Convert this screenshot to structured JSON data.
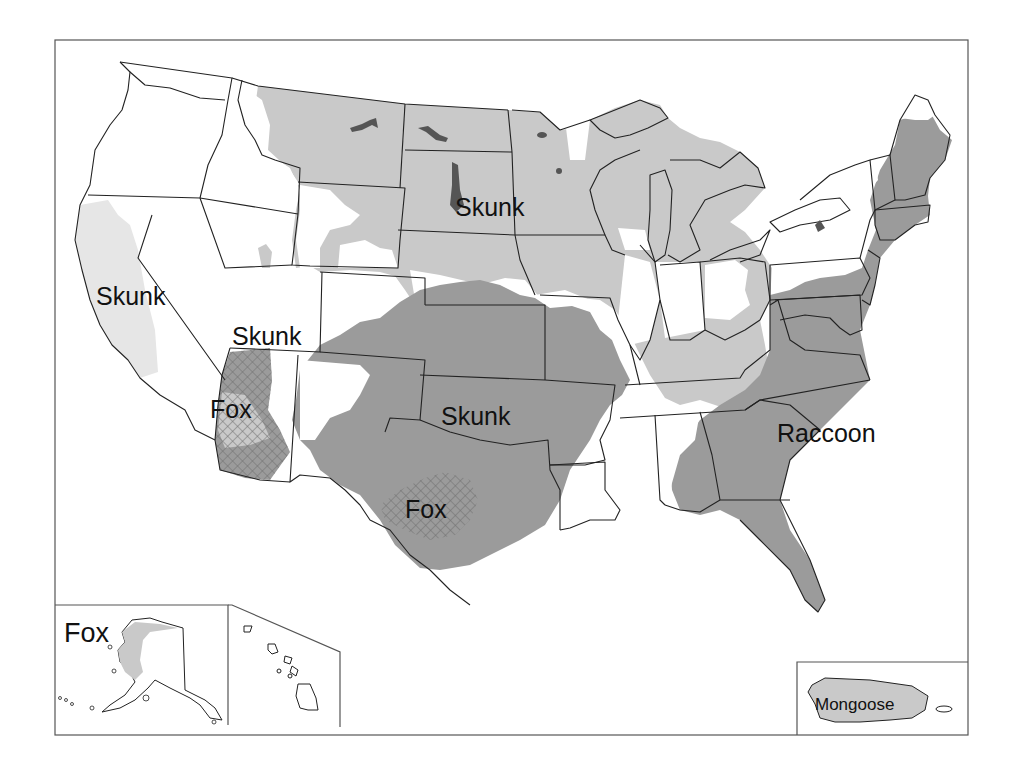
{
  "map": {
    "title": "",
    "colors": {
      "background": "#ffffff",
      "skunk_light": "#c9c9c9",
      "skunk_california": "#e6e6e6",
      "raccoon_dark": "#9b9b9b",
      "fox_hatch": "#7a7a7a",
      "border": "#222222",
      "water": "#555555"
    },
    "labels": [
      {
        "id": "skunk-north-central",
        "text": "Skunk",
        "x": 455,
        "y": 216
      },
      {
        "id": "skunk-california",
        "text": "Skunk",
        "x": 96,
        "y": 305
      },
      {
        "id": "skunk-southwest",
        "text": "Skunk",
        "x": 232,
        "y": 345
      },
      {
        "id": "fox-arizona",
        "text": "Fox",
        "x": 210,
        "y": 418
      },
      {
        "id": "skunk-south-central",
        "text": "Skunk",
        "x": 441,
        "y": 425
      },
      {
        "id": "raccoon-east",
        "text": "Raccoon",
        "x": 777,
        "y": 442
      },
      {
        "id": "fox-texas",
        "text": "Fox",
        "x": 405,
        "y": 518
      },
      {
        "id": "fox-alaska",
        "text": "Fox",
        "x": 64,
        "y": 642
      },
      {
        "id": "mongoose-puerto-rico",
        "text": "Mongoose",
        "x": 815,
        "y": 710
      }
    ],
    "insets": [
      {
        "id": "alaska-inset",
        "name": "Alaska"
      },
      {
        "id": "hawaii-inset",
        "name": "Hawaii"
      },
      {
        "id": "puerto-rico-inset",
        "name": "Puerto Rico"
      }
    ]
  }
}
